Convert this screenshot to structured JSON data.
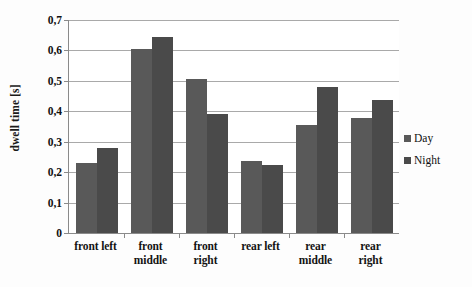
{
  "chart_data": {
    "type": "bar",
    "title": "",
    "xlabel": "",
    "ylabel": "dwell time [s]",
    "categories": [
      "front left",
      "front middle",
      "front right",
      "rear left",
      "rear middle",
      "rear right"
    ],
    "category_lines": [
      [
        "front left",
        ""
      ],
      [
        "front",
        "middle"
      ],
      [
        "front",
        "right"
      ],
      [
        "rear left",
        ""
      ],
      [
        "rear",
        "middle"
      ],
      [
        "rear",
        "right"
      ]
    ],
    "series": [
      {
        "name": "Day",
        "color": "#595959",
        "values": [
          0.23,
          0.605,
          0.505,
          0.238,
          0.355,
          0.378
        ]
      },
      {
        "name": "Night",
        "color": "#4a4a4a",
        "values": [
          0.28,
          0.645,
          0.39,
          0.225,
          0.48,
          0.438
        ]
      }
    ],
    "ylim": [
      0,
      0.7
    ],
    "ytick_values": [
      0,
      0.1,
      0.2,
      0.3,
      0.4,
      0.5,
      0.6,
      0.7
    ],
    "ytick_labels": [
      "0",
      "0,1",
      "0,2",
      "0,3",
      "0,4",
      "0,5",
      "0,6",
      "0,7"
    ],
    "grid": true,
    "grid_axis": "y",
    "legend_position": "right",
    "decimal_separator": ","
  }
}
